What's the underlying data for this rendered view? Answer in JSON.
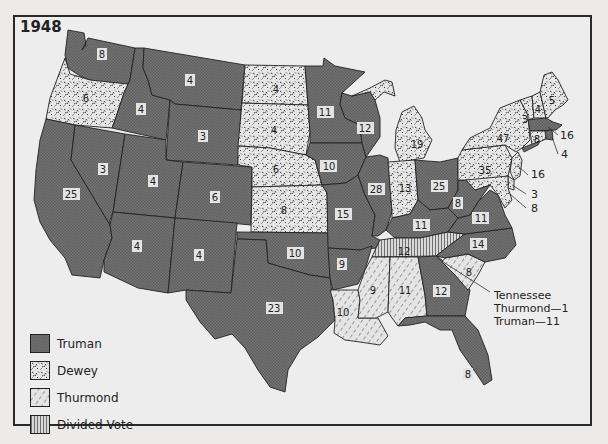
{
  "title": "1948",
  "colors": {
    "truman": "#6f6f6f",
    "dewey": "#dcdcdc",
    "thurmond": "#e2e2e2",
    "divided": "#cfcfcf",
    "border": "#222222",
    "background": "#eeeded"
  },
  "legend": [
    {
      "key": "truman",
      "label": "Truman"
    },
    {
      "key": "dewey",
      "label": "Dewey"
    },
    {
      "key": "thurmond",
      "label": "Thurmond"
    },
    {
      "key": "divided",
      "label": "Divided Vote"
    }
  ],
  "note": {
    "line1": "Tennessee",
    "line2": "Thurmond—1",
    "line3": "Truman—11"
  },
  "callouts": {
    "ma": "16",
    "ri": "4",
    "nj": "16",
    "de": "3",
    "md": "8"
  },
  "states": [
    {
      "id": "WA",
      "winner": "truman",
      "ev": "8"
    },
    {
      "id": "OR",
      "winner": "dewey",
      "ev": "6"
    },
    {
      "id": "CA",
      "winner": "truman",
      "ev": "25"
    },
    {
      "id": "ID",
      "winner": "truman",
      "ev": "4"
    },
    {
      "id": "NV",
      "winner": "truman",
      "ev": "3"
    },
    {
      "id": "MT",
      "winner": "truman",
      "ev": "4"
    },
    {
      "id": "WY",
      "winner": "truman",
      "ev": "3"
    },
    {
      "id": "UT",
      "winner": "truman",
      "ev": "4"
    },
    {
      "id": "AZ",
      "winner": "truman",
      "ev": "4"
    },
    {
      "id": "CO",
      "winner": "truman",
      "ev": "6"
    },
    {
      "id": "NM",
      "winner": "truman",
      "ev": "4"
    },
    {
      "id": "ND",
      "winner": "dewey",
      "ev": "4"
    },
    {
      "id": "SD",
      "winner": "dewey",
      "ev": "4"
    },
    {
      "id": "NE",
      "winner": "dewey",
      "ev": "6"
    },
    {
      "id": "KS",
      "winner": "dewey",
      "ev": "8"
    },
    {
      "id": "OK",
      "winner": "truman",
      "ev": "10"
    },
    {
      "id": "TX",
      "winner": "truman",
      "ev": "23"
    },
    {
      "id": "MN",
      "winner": "truman",
      "ev": "11"
    },
    {
      "id": "IA",
      "winner": "truman",
      "ev": "10"
    },
    {
      "id": "MO",
      "winner": "truman",
      "ev": "15"
    },
    {
      "id": "AR",
      "winner": "truman",
      "ev": "9"
    },
    {
      "id": "LA",
      "winner": "thurmond",
      "ev": "10"
    },
    {
      "id": "WI",
      "winner": "truman",
      "ev": "12"
    },
    {
      "id": "IL",
      "winner": "truman",
      "ev": "28"
    },
    {
      "id": "MI",
      "winner": "dewey",
      "ev": "19"
    },
    {
      "id": "IN",
      "winner": "dewey",
      "ev": "13"
    },
    {
      "id": "OH",
      "winner": "truman",
      "ev": "25"
    },
    {
      "id": "KY",
      "winner": "truman",
      "ev": "11"
    },
    {
      "id": "TN",
      "winner": "divided",
      "ev": "12"
    },
    {
      "id": "MS",
      "winner": "thurmond",
      "ev": "9"
    },
    {
      "id": "AL",
      "winner": "thurmond",
      "ev": "11"
    },
    {
      "id": "GA",
      "winner": "truman",
      "ev": "12"
    },
    {
      "id": "FL",
      "winner": "truman",
      "ev": "8"
    },
    {
      "id": "SC",
      "winner": "thurmond",
      "ev": "8"
    },
    {
      "id": "NC",
      "winner": "truman",
      "ev": "14"
    },
    {
      "id": "VA",
      "winner": "truman",
      "ev": "11"
    },
    {
      "id": "WV",
      "winner": "truman",
      "ev": "8"
    },
    {
      "id": "PA",
      "winner": "dewey",
      "ev": "35"
    },
    {
      "id": "NY",
      "winner": "dewey",
      "ev": "47"
    },
    {
      "id": "VT",
      "winner": "dewey",
      "ev": "3"
    },
    {
      "id": "NH",
      "winner": "dewey",
      "ev": "4"
    },
    {
      "id": "ME",
      "winner": "dewey",
      "ev": "5"
    },
    {
      "id": "MA",
      "winner": "truman",
      "ev": "16"
    },
    {
      "id": "RI",
      "winner": "truman",
      "ev": "4"
    },
    {
      "id": "CT",
      "winner": "dewey",
      "ev": "8"
    },
    {
      "id": "NJ",
      "winner": "dewey",
      "ev": "16"
    },
    {
      "id": "DE",
      "winner": "dewey",
      "ev": "3"
    },
    {
      "id": "MD",
      "winner": "dewey",
      "ev": "8"
    }
  ]
}
